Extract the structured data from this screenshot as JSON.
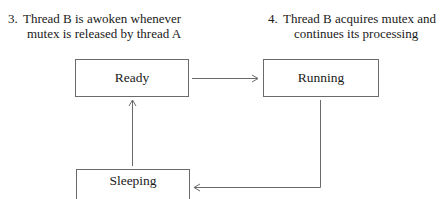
{
  "notes": [
    {
      "number": "3.",
      "line1": "Thread B is awoken whenever",
      "line2": "mutex is released by thread A"
    },
    {
      "number": "4.",
      "line1": "Thread B acquires mutex and",
      "line2": "continues its processing"
    }
  ],
  "states": {
    "ready": "Ready",
    "running": "Running",
    "sleeping": "Sleeping"
  },
  "transitions": [
    {
      "from": "Ready",
      "to": "Running"
    },
    {
      "from": "Running",
      "to": "Sleeping"
    },
    {
      "from": "Sleeping",
      "to": "Ready"
    }
  ],
  "colors": {
    "line": "#6a6a6a",
    "text": "#1a1a1a",
    "background": "#ffffff"
  }
}
